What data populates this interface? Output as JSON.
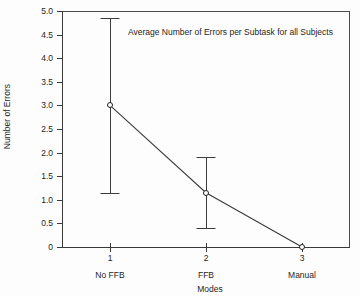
{
  "chart_data": {
    "type": "line",
    "title": "Average Number of Errors per Subtask for all Subjects",
    "xlabel": "Modes",
    "ylabel": "Number of Errors",
    "grid": false,
    "legend": "none",
    "xlim": [
      0.5,
      3.5
    ],
    "ylim": [
      0,
      5.0
    ],
    "x": [
      1,
      2,
      3
    ],
    "categories": [
      "No FFB",
      "FFB",
      "Manual"
    ],
    "xtick_numbers": [
      "1",
      "2",
      "3"
    ],
    "values": [
      3.0,
      1.15,
      0.0
    ],
    "error_bars": [
      {
        "x": 1,
        "value": 3.0,
        "upper": 4.85,
        "lower": 1.15
      },
      {
        "x": 2,
        "value": 1.15,
        "upper": 1.9,
        "lower": 0.4
      },
      {
        "x": 3,
        "value": 0.0,
        "upper": 0.0,
        "lower": 0.0
      }
    ],
    "ytick_labels": [
      "5.0",
      "4.5",
      "4.0",
      "3.5",
      "3.0",
      "2.5",
      "2.0",
      "1.5",
      "1.0",
      "0.5",
      "0"
    ],
    "ytick_values": [
      5.0,
      4.5,
      4.0,
      3.5,
      3.0,
      2.5,
      2.0,
      1.5,
      1.0,
      0.5,
      0
    ],
    "marker": "open-circle",
    "line_color": "#3c3c3c",
    "marker_color": "#1f1f1f",
    "background": "#ffffff"
  }
}
